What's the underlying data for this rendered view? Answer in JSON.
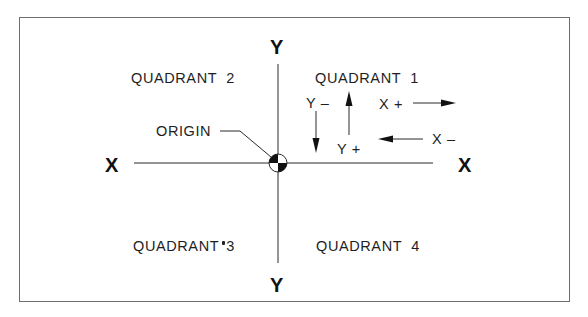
{
  "diagram": {
    "type": "cartesian-quadrants",
    "axes": {
      "x_left_label": "X",
      "x_right_label": "X",
      "y_top_label": "Y",
      "y_bottom_label": "Y"
    },
    "quadrants": [
      {
        "id": 1,
        "label": "QUADRANT  1"
      },
      {
        "id": 2,
        "label": "QUADRANT  2"
      },
      {
        "id": 3,
        "label": "QUADRANT",
        "suffix": "3"
      },
      {
        "id": 4,
        "label": "QUADRANT  4"
      }
    ],
    "origin_label": "ORIGIN",
    "directions": {
      "y_minus": "Y –",
      "y_plus": "Y +",
      "x_plus": "X +",
      "x_minus": "X –"
    },
    "colors": {
      "line": "#2a2a2a",
      "frame": "#6e6e6e",
      "background": "#ffffff"
    }
  }
}
